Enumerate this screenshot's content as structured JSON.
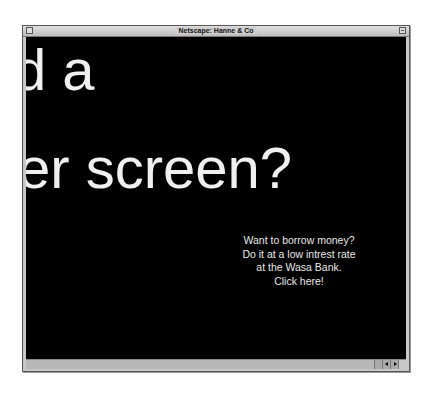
{
  "window": {
    "title": "Netscape: Hanne & Co"
  },
  "content": {
    "headline_line1": "d a",
    "headline_line2": "er screen?",
    "promo_lines": [
      "Want to borrow money?",
      "Do it at a low intrest rate",
      "at the Wasa Bank.",
      "Click here!"
    ]
  },
  "icons": {
    "close": "close-box-icon",
    "zoom": "zoom-box-icon",
    "left": "arrow-left-icon",
    "right": "arrow-right-icon"
  },
  "colors": {
    "background": "#000000",
    "text": "#f0f0f0",
    "chrome": "#c8c8c8"
  }
}
